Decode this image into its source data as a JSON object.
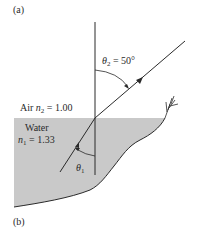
{
  "panel_labels": {
    "a": "(a)",
    "b": "(b)"
  },
  "air": {
    "name": "Air",
    "symbol": "n",
    "subscript": "2",
    "equals": "= 1.00"
  },
  "water": {
    "name": "Water",
    "symbol": "n",
    "subscript": "1",
    "equals": "= 1.33"
  },
  "angles": {
    "refracted": {
      "symbol": "θ",
      "subscript": "2",
      "value": "= 50°"
    },
    "incident": {
      "symbol": "θ",
      "subscript": "1"
    }
  },
  "colors": {
    "water_fill": "#c9c9c9",
    "line": "#2a2a2a",
    "background": "#ffffff"
  }
}
